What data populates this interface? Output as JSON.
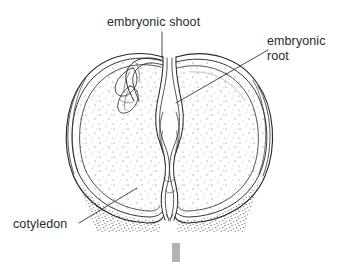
{
  "figure": {
    "kind": "botanical-line-diagram",
    "background_color": "#ffffff",
    "ink_color": "#2b2b2b",
    "stipple_color": "#4a4a4a",
    "accent_bar_color": "#b3b3b3"
  },
  "labels": {
    "embryonic_shoot": "embryonic shoot",
    "embryonic_root_line1": "embryonic",
    "embryonic_root_line2": "root",
    "cotyledon": "cotyledon"
  },
  "parts": [
    {
      "id": "embryonic-shoot",
      "name": "embryonic shoot",
      "label": "embryonic shoot"
    },
    {
      "id": "embryonic-root",
      "name": "embryonic root",
      "label": "embryonic root"
    },
    {
      "id": "cotyledon-left",
      "name": "cotyledon",
      "label": "cotyledon"
    },
    {
      "id": "cotyledon-right",
      "name": "cotyledon",
      "label": "cotyledon"
    }
  ],
  "leader_lines": [
    {
      "id": "leader-embryonic-shoot",
      "from_label": "embryonic shoot",
      "orientation": "vertical"
    },
    {
      "id": "leader-embryonic-root",
      "from_label": "embryonic root",
      "orientation": "diagonal"
    },
    {
      "id": "leader-cotyledon",
      "from_label": "cotyledon",
      "orientation": "diagonal"
    }
  ]
}
